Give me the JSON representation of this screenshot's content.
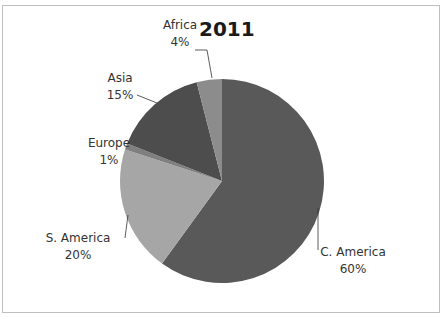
{
  "chart_data": {
    "type": "pie",
    "title": "2011",
    "categories": [
      "C. America",
      "S. America",
      "Europe",
      "Asia",
      "Africa"
    ],
    "values": [
      60,
      20,
      1,
      15,
      4
    ],
    "labels": [
      "60%",
      "20%",
      "1%",
      "15%",
      "4%"
    ],
    "colors": [
      "#595959",
      "#a6a6a6",
      "#7f7f7f",
      "#4d4d4d",
      "#8c8c8c"
    ],
    "start_angle": "12 o'clock, clockwise",
    "legend": "none (data labels with leader lines)"
  },
  "labels": {
    "c_america": {
      "name": "C. America",
      "pct": "60%"
    },
    "s_america": {
      "name": "S. America",
      "pct": "20%"
    },
    "europe": {
      "name": "Europe",
      "pct": "1%"
    },
    "asia": {
      "name": "Asia",
      "pct": "15%"
    },
    "africa": {
      "name": "Africa",
      "pct": "4%"
    }
  }
}
